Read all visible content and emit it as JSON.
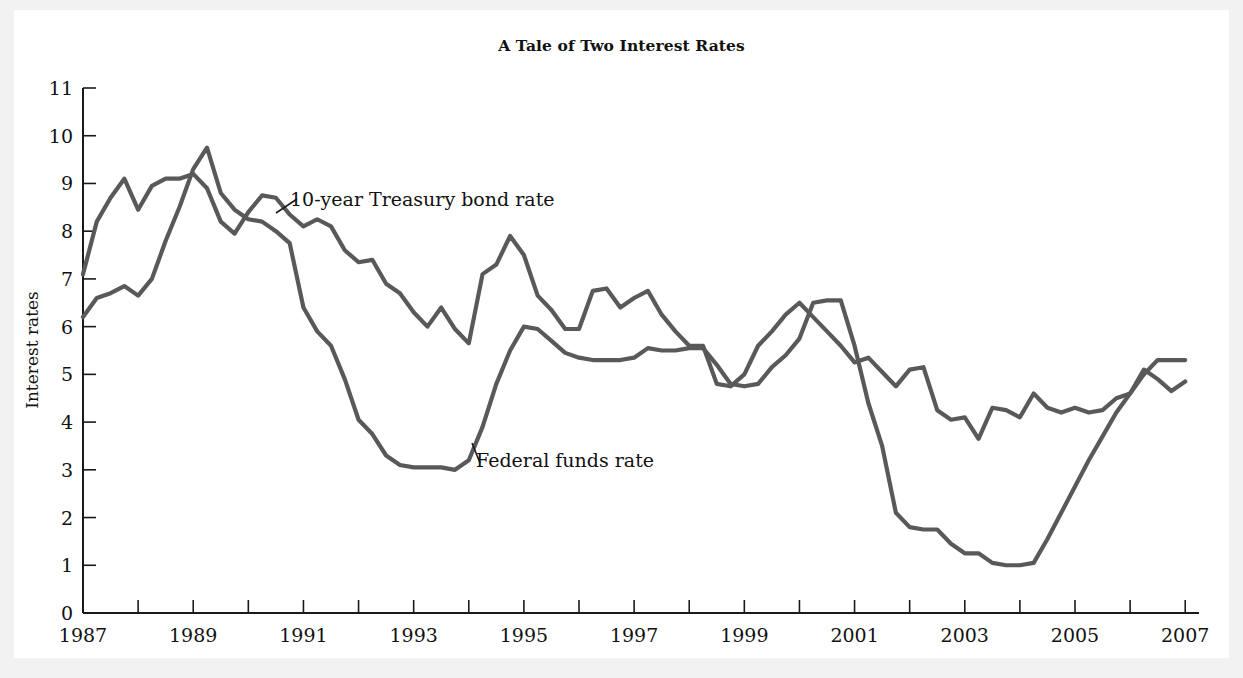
{
  "figure": {
    "title": "A Tale of Two Interest Rates",
    "background_color": "#f2f2f2",
    "plate_color": "#ffffff",
    "line_color": "#595959",
    "axis_color": "#1a1a1a"
  },
  "annotations": {
    "treasury_label": "10-year Treasury bond rate",
    "fedfunds_label": "Federal funds rate"
  },
  "axes": {
    "y_title": "Interest rates",
    "y_ticks": [
      "0",
      "1",
      "2",
      "3",
      "4",
      "5",
      "6",
      "7",
      "8",
      "9",
      "10",
      "11"
    ],
    "x_ticks_labeled": [
      "1987",
      "1989",
      "1991",
      "1993",
      "1995",
      "1997",
      "1999",
      "2001",
      "2003",
      "2005",
      "2007"
    ]
  },
  "chart_data": {
    "type": "line",
    "title": "A Tale of Two Interest Rates",
    "xlabel": "",
    "ylabel": "Interest rates",
    "xlim": [
      1987,
      2007.25
    ],
    "ylim": [
      0,
      11
    ],
    "y_ticks": [
      0,
      1,
      2,
      3,
      4,
      5,
      6,
      7,
      8,
      9,
      10,
      11
    ],
    "x_ticks": [
      1987,
      1988,
      1989,
      1990,
      1991,
      1992,
      1993,
      1994,
      1995,
      1996,
      1997,
      1998,
      1999,
      2000,
      2001,
      2002,
      2003,
      2004,
      2005,
      2006,
      2007
    ],
    "x_tick_labels_shown": [
      1987,
      1989,
      1991,
      1993,
      1995,
      1997,
      1999,
      2001,
      2003,
      2005,
      2007
    ],
    "grid": false,
    "legend": "inline-annotations",
    "legend_position": "inline",
    "x_unit": "year (quarterly observations)",
    "y_unit": "percent",
    "x": [
      1987.0,
      1987.25,
      1987.5,
      1987.75,
      1988.0,
      1988.25,
      1988.5,
      1988.75,
      1989.0,
      1989.25,
      1989.5,
      1989.75,
      1990.0,
      1990.25,
      1990.5,
      1990.75,
      1991.0,
      1991.25,
      1991.5,
      1991.75,
      1992.0,
      1992.25,
      1992.5,
      1992.75,
      1993.0,
      1993.25,
      1993.5,
      1993.75,
      1994.0,
      1994.25,
      1994.5,
      1994.75,
      1995.0,
      1995.25,
      1995.5,
      1995.75,
      1996.0,
      1996.25,
      1996.5,
      1996.75,
      1997.0,
      1997.25,
      1997.5,
      1997.75,
      1998.0,
      1998.25,
      1998.5,
      1998.75,
      1999.0,
      1999.25,
      1999.5,
      1999.75,
      2000.0,
      2000.25,
      2000.5,
      2000.75,
      2001.0,
      2001.25,
      2001.5,
      2001.75,
      2002.0,
      2002.25,
      2002.5,
      2002.75,
      2003.0,
      2003.25,
      2003.5,
      2003.75,
      2004.0,
      2004.25,
      2004.5,
      2004.75,
      2005.0,
      2005.25,
      2005.5,
      2005.75,
      2006.0,
      2006.25,
      2006.5,
      2006.75,
      2007.0
    ],
    "series": [
      {
        "name": "10-year Treasury bond rate",
        "color": "#595959",
        "values": [
          7.1,
          8.2,
          8.7,
          9.1,
          8.45,
          8.95,
          9.1,
          9.1,
          9.2,
          8.9,
          8.2,
          7.95,
          8.4,
          8.75,
          8.7,
          8.35,
          8.1,
          8.25,
          8.1,
          7.6,
          7.35,
          7.4,
          6.9,
          6.7,
          6.3,
          6.0,
          6.4,
          5.95,
          5.65,
          7.1,
          7.3,
          7.9,
          7.5,
          6.65,
          6.35,
          5.95,
          5.95,
          6.75,
          6.8,
          6.4,
          6.6,
          6.75,
          6.25,
          5.9,
          5.6,
          5.6,
          4.8,
          4.75,
          5.0,
          5.6,
          5.9,
          6.25,
          6.5,
          6.2,
          5.9,
          5.6,
          5.25,
          5.35,
          5.05,
          4.75,
          5.1,
          5.15,
          4.25,
          4.05,
          4.1,
          3.65,
          4.3,
          4.25,
          4.1,
          4.6,
          4.3,
          4.2,
          4.3,
          4.2,
          4.25,
          4.5,
          4.6,
          5.1,
          4.9,
          4.65,
          4.85
        ]
      },
      {
        "name": "Federal funds rate",
        "color": "#595959",
        "values": [
          6.2,
          6.6,
          6.7,
          6.85,
          6.65,
          7.0,
          7.8,
          8.5,
          9.3,
          9.75,
          8.8,
          8.45,
          8.25,
          8.2,
          8.0,
          7.75,
          6.4,
          5.9,
          5.6,
          4.9,
          4.05,
          3.75,
          3.3,
          3.1,
          3.05,
          3.05,
          3.05,
          3.0,
          3.2,
          3.9,
          4.8,
          5.5,
          6.0,
          5.95,
          5.7,
          5.45,
          5.35,
          5.3,
          5.3,
          5.3,
          5.35,
          5.55,
          5.5,
          5.5,
          5.55,
          5.55,
          5.2,
          4.8,
          4.75,
          4.8,
          5.15,
          5.4,
          5.75,
          6.5,
          6.55,
          6.55,
          5.6,
          4.4,
          3.5,
          2.1,
          1.8,
          1.75,
          1.75,
          1.45,
          1.25,
          1.25,
          1.05,
          1.0,
          1.0,
          1.05,
          1.55,
          2.1,
          2.65,
          3.2,
          3.7,
          4.2,
          4.6,
          5.0,
          5.3,
          5.3,
          5.3
        ]
      }
    ]
  }
}
